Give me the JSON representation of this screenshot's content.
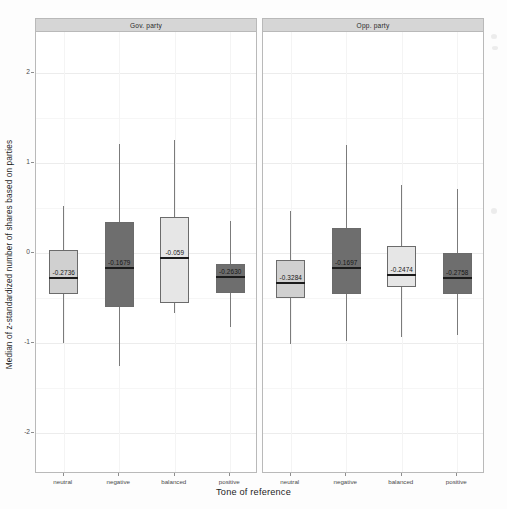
{
  "chart_data": {
    "type": "box",
    "title": "",
    "xlabel": "Tone of reference",
    "ylabel": "Median of z-standardized number of shares based on parties",
    "ylim": [
      -2.45,
      2.45
    ],
    "yticks": [
      2,
      1,
      0,
      -1,
      -2
    ],
    "ytick_labels": [
      "2",
      "1",
      "0",
      "-1",
      "-2"
    ],
    "grid": true,
    "legend_position": "none",
    "categories": [
      "neutral",
      "negative",
      "balanced",
      "positive"
    ],
    "facets": [
      {
        "label": "Gov. party",
        "boxes": [
          {
            "category": "neutral",
            "fill": "#d0d0d0",
            "lower_whisker": -1.0,
            "q1": -0.45,
            "median": -0.2736,
            "q3": 0.03,
            "upper_whisker": 0.52,
            "median_label": "-0.2736"
          },
          {
            "category": "negative",
            "fill": "#6e6e6e",
            "lower_whisker": -1.25,
            "q1": -0.6,
            "median": -0.1679,
            "q3": 0.34,
            "upper_whisker": 1.21,
            "median_label": "-0.1679"
          },
          {
            "category": "balanced",
            "fill": "#e6e6e6",
            "lower_whisker": -0.66,
            "q1": -0.55,
            "median": -0.059,
            "q3": 0.4,
            "upper_whisker": 1.25,
            "median_label": "-0.059"
          },
          {
            "category": "positive",
            "fill": "#6e6e6e",
            "lower_whisker": -0.82,
            "q1": -0.44,
            "median": -0.263,
            "q3": -0.12,
            "upper_whisker": 0.35,
            "median_label": "-0.2630"
          }
        ]
      },
      {
        "label": "Opp. party",
        "boxes": [
          {
            "category": "neutral",
            "fill": "#d0d0d0",
            "lower_whisker": -1.01,
            "q1": -0.5,
            "median": -0.3284,
            "q3": -0.08,
            "upper_whisker": 0.47,
            "median_label": "-0.3284"
          },
          {
            "category": "negative",
            "fill": "#6e6e6e",
            "lower_whisker": -0.98,
            "q1": -0.45,
            "median": -0.1697,
            "q3": 0.28,
            "upper_whisker": 1.2,
            "median_label": "-0.1697"
          },
          {
            "category": "balanced",
            "fill": "#e6e6e6",
            "lower_whisker": -0.93,
            "q1": -0.38,
            "median": -0.2474,
            "q3": 0.08,
            "upper_whisker": 0.75,
            "median_label": "-0.2474"
          },
          {
            "category": "positive",
            "fill": "#6e6e6e",
            "lower_whisker": -0.91,
            "q1": -0.45,
            "median": -0.2758,
            "q3": -0.0,
            "upper_whisker": 0.71,
            "median_label": "-0.2758"
          }
        ]
      }
    ]
  }
}
